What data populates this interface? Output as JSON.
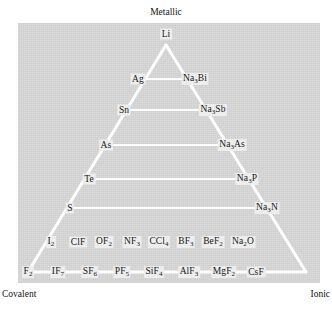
{
  "figure": {
    "type": "van-arkel-ketelaar-triangle",
    "corner_labels": {
      "top": "Metallic",
      "bottom_left": "Covalent",
      "bottom_right": "Ionic"
    },
    "apex": {
      "label": "Li"
    },
    "rows": [
      {
        "left": "Ag",
        "right": "Na₃Bi",
        "left_html": "Ag",
        "right_html": "Na<sub>3</sub>Bi"
      },
      {
        "left": "Sn",
        "right": "Na₃Sb",
        "left_html": "Sn",
        "right_html": "Na<sub>3</sub>Sb"
      },
      {
        "left": "As",
        "right": "Na₃As",
        "left_html": "As",
        "right_html": "Na<sub>3</sub>As"
      },
      {
        "left": "Te",
        "right": "Na₃P",
        "left_html": "Te",
        "right_html": "Na<sub>3</sub>P"
      },
      {
        "left": "S",
        "right": "Na₃N",
        "left_html": "S",
        "right_html": "Na<sub>3</sub>N"
      }
    ],
    "row_penultimate": {
      "items": [
        "I₂",
        "ClF",
        "OF₂",
        "NF₃",
        "CCl₄",
        "BF₃",
        "BeF₂",
        "Na₂O"
      ],
      "items_html": [
        "I<sub>2</sub>",
        "ClF",
        "OF<sub>2</sub>",
        "NF<sub>3</sub>",
        "CCl<sub>4</sub>",
        "BF<sub>3</sub>",
        "BeF<sub>2</sub>",
        "Na<sub>2</sub>O"
      ]
    },
    "row_base": {
      "items": [
        "F₂",
        "IF₇",
        "SF₆",
        "PF₅",
        "SiF₄",
        "AlF₃",
        "MgF₂",
        "CsF"
      ],
      "items_html": [
        "F<sub>2</sub>",
        "IF<sub>7</sub>",
        "SF<sub>6</sub>",
        "PF<sub>5</sub>",
        "SiF<sub>4</sub>",
        "AlF<sub>3</sub>",
        "MgF<sub>2</sub>",
        "CsF"
      ]
    },
    "colors": {
      "plate": "#d7d7d7",
      "lines": "#ffffff",
      "text": "#181818"
    }
  },
  "chart_data": {
    "type": "diagram",
    "title": "",
    "axes": {
      "top_vertex": "Metallic",
      "left_vertex": "Covalent",
      "right_vertex": "Ionic"
    },
    "apex_point": "Li",
    "tie_lines": [
      {
        "left": "Ag",
        "right": "Na3Bi"
      },
      {
        "left": "Sn",
        "right": "Na3Sb"
      },
      {
        "left": "As",
        "right": "Na3As"
      },
      {
        "left": "Te",
        "right": "Na3P"
      },
      {
        "left": "S",
        "right": "Na3N"
      }
    ],
    "interior_row": [
      "I2",
      "ClF",
      "OF2",
      "NF3",
      "CCl4",
      "BF3",
      "BeF2",
      "Na2O"
    ],
    "base_row": [
      "F2",
      "IF7",
      "SF6",
      "PF5",
      "SiF4",
      "AlF3",
      "MgF2",
      "CsF"
    ]
  },
  "geometry": {
    "apex": {
      "x": 166,
      "y": 45
    },
    "base_l": {
      "x": 28,
      "y": 272
    },
    "base_r": {
      "x": 306,
      "y": 272
    },
    "rung_y": [
      79,
      110,
      145,
      179,
      208
    ],
    "rung_x": [
      [
        140,
        193
      ],
      [
        126,
        209
      ],
      [
        108,
        227
      ],
      [
        91,
        244
      ],
      [
        72,
        263
      ]
    ],
    "interior_y": 242,
    "interior_x": [
      51,
      78,
      104,
      132,
      159,
      186,
      213,
      243
    ],
    "base_y": 272,
    "base_x": [
      28,
      58,
      86,
      115,
      143,
      172,
      203,
      236,
      263,
      289,
      306
    ],
    "base_label_x": [
      28,
      58,
      90,
      122,
      154,
      189,
      224,
      256,
      290,
      306
    ]
  }
}
